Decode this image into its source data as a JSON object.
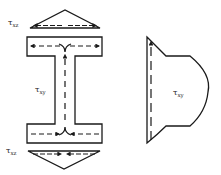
{
  "diagram": {
    "type": "shear stress distribution in I-beam",
    "labels": {
      "top_flange_stress": {
        "symbol": "τ",
        "subscript": "xz"
      },
      "bottom_flange_stress": {
        "symbol": "τ",
        "subscript": "xz"
      },
      "web_stress": {
        "symbol": "τ",
        "subscript": "xy"
      },
      "web_distribution": {
        "symbol": "τ",
        "subscript": "xy"
      }
    },
    "colors": {
      "ink": "#1a1a1a",
      "background": "#ffffff"
    },
    "shapes": [
      {
        "name": "top-flange-stress-triangle",
        "arrow_direction": "outward from center"
      },
      {
        "name": "i-beam-section",
        "flow": "shear flow from flanges into web, upward in web"
      },
      {
        "name": "bottom-flange-stress-triangle",
        "arrow_direction": "inward to center"
      },
      {
        "name": "web-shear-distribution",
        "arrow_direction": "upward"
      }
    ]
  }
}
